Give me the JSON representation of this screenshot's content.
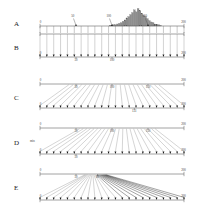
{
  "figure": {
    "panels": [
      {
        "letter": "A",
        "name": "histogram-panel",
        "axis": {
          "min": 0,
          "max": 200,
          "start_label": "0",
          "end_label": "200"
        },
        "callouts": [
          {
            "label": "50",
            "value": 50
          },
          {
            "label": "100",
            "value": 100
          },
          {
            "label": "150",
            "value": 150
          }
        ],
        "n_minor_ticks": 21,
        "histogram": {
          "bin_start": 96,
          "bin_width": 2.6,
          "values": [
            1,
            1,
            2,
            2,
            3,
            4,
            5,
            7,
            9,
            12,
            14,
            17,
            20,
            24,
            21,
            26,
            23,
            19,
            16,
            14,
            11,
            8,
            6,
            5,
            3,
            2,
            2,
            1
          ]
        }
      },
      {
        "letter": "B",
        "name": "uniform-mapping-panel",
        "top_axis": {
          "min": 0,
          "max": 200,
          "start_label": "",
          "end_label": ""
        },
        "bottom_axis": {
          "min": 0,
          "max": 200,
          "start_label": "0",
          "end_label": "200"
        },
        "bottom_ticks": [
          {
            "label": "50",
            "value": 50
          },
          {
            "label": "100",
            "value": 100
          }
        ],
        "n_lines": 21
      },
      {
        "letter": "C",
        "name": "converging-mapping-panel",
        "top_axis": {
          "min": 0,
          "max": 200,
          "start_label": "0",
          "end_label": "200"
        },
        "top_ticks": [
          {
            "label": "50",
            "value": 50
          },
          {
            "label": "100",
            "value": 100
          },
          {
            "label": "150",
            "value": 150
          }
        ],
        "bottom_axis": {
          "min": 0,
          "max": 200,
          "start_label": "0",
          "end_label": "200"
        },
        "bottom_ticks": [
          {
            "label": "131",
            "value": 131
          }
        ],
        "n_lines": 21,
        "source_start": 40,
        "source_end": 165
      },
      {
        "letter": "D",
        "name": "skewed-mapping-panel",
        "top_axis": {
          "min": 0,
          "max": 200,
          "start_label": "0",
          "end_label": "200"
        },
        "top_ticks": [
          {
            "label": "50",
            "value": 50
          },
          {
            "label": "100",
            "value": 100
          },
          {
            "label": "150",
            "value": 150
          }
        ],
        "bottom_axis": {
          "min": 0,
          "max": 200,
          "start_label": "0",
          "end_label": "200"
        },
        "bottom_ticks": [
          {
            "label": "50",
            "value": 50
          }
        ],
        "annotation": "min",
        "n_lines": 21,
        "source_start": 55,
        "source_end": 160
      },
      {
        "letter": "E",
        "name": "collapsed-mapping-panel",
        "top_axis": {
          "min": 0,
          "max": 200,
          "start_label": "0",
          "end_label": "200"
        },
        "top_ticks": [
          {
            "label": "50",
            "value": 50
          },
          {
            "label": "80",
            "value": 80
          }
        ],
        "bottom_axis": {
          "min": 0,
          "max": 200,
          "start_label": "0",
          "end_label": "200"
        },
        "n_lines": 21,
        "source_start": 62,
        "source_end": 92
      }
    ]
  },
  "colors": {
    "axis": "#555555",
    "line": "#7a7a7a",
    "bar_fill": "#8e8e8e",
    "arrow": "#111111",
    "background": "#ffffff"
  }
}
